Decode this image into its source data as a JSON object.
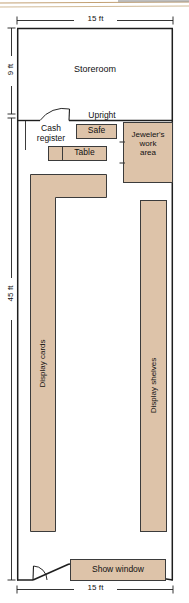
{
  "diagram": {
    "type": "floor-plan",
    "colors": {
      "fixture_fill": "#ddc3a9",
      "fixture_stroke": "#3b3b3b",
      "wall_stroke": "#1e1e1e",
      "background": "#ffffff",
      "header_rule": "#b99a6b"
    }
  },
  "header": {
    "clipped_banner": "",
    "note": "top edge shows a cropped page banner rule"
  },
  "dimensions": {
    "top_width": "15 ft",
    "bottom_width": "15 ft",
    "storeroom_depth": "9 ft",
    "sales_floor_depth": "45 ft"
  },
  "rooms": [
    {
      "id": "storeroom",
      "label": "Storeroom"
    }
  ],
  "fixtures": [
    {
      "id": "cash-register",
      "label": "Cash\nregister",
      "filled": false
    },
    {
      "id": "upright",
      "label": "Upright",
      "filled": false
    },
    {
      "id": "safe",
      "label": "Safe",
      "filled": true
    },
    {
      "id": "table",
      "label": "Table",
      "filled": true
    },
    {
      "id": "jewelers-work-area",
      "label": "Jeweler's\nwork\narea",
      "filled": true
    },
    {
      "id": "display-cards",
      "label": "Display cards",
      "filled": true,
      "orientation": "vertical"
    },
    {
      "id": "display-shelves",
      "label": "Display shelves",
      "filled": true,
      "orientation": "vertical"
    },
    {
      "id": "show-window",
      "label": "Show window",
      "filled": true
    }
  ],
  "doors": [
    {
      "id": "storeroom-door",
      "kind": "swing-arc"
    },
    {
      "id": "entry-door",
      "kind": "swing-arc"
    }
  ]
}
